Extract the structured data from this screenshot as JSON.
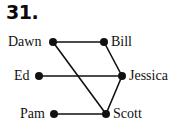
{
  "figure": {
    "problem_number": "31.",
    "background_color": "#ffffff",
    "ink_color": "#111111",
    "width": 186,
    "height": 135
  },
  "graph": {
    "type": "undirected-graph",
    "node_radius": 4,
    "edge_width": 1.6,
    "nodes": [
      {
        "id": "dawn",
        "label": "Dawn",
        "x": 53,
        "y": 42,
        "label_side": "left",
        "label_x": 8,
        "label_y": 35
      },
      {
        "id": "bill",
        "label": "Bill",
        "x": 104,
        "y": 42,
        "label_side": "right",
        "label_x": 111,
        "label_y": 35
      },
      {
        "id": "ed",
        "label": "Ed",
        "x": 39,
        "y": 76,
        "label_side": "left",
        "label_x": 14,
        "label_y": 69
      },
      {
        "id": "jessica",
        "label": "Jessica",
        "x": 122,
        "y": 76,
        "label_side": "right",
        "label_x": 129,
        "label_y": 69
      },
      {
        "id": "pam",
        "label": "Pam",
        "x": 54,
        "y": 114,
        "label_side": "left",
        "label_x": 20,
        "label_y": 107
      },
      {
        "id": "scott",
        "label": "Scott",
        "x": 106,
        "y": 114,
        "label_side": "right",
        "label_x": 113,
        "label_y": 107
      }
    ],
    "edges": [
      {
        "id": "dawn-bill",
        "from": "dawn",
        "to": "bill"
      },
      {
        "id": "dawn-scott",
        "from": "dawn",
        "to": "scott"
      },
      {
        "id": "bill-jessica",
        "from": "bill",
        "to": "jessica"
      },
      {
        "id": "ed-jessica",
        "from": "ed",
        "to": "jessica"
      },
      {
        "id": "pam-scott",
        "from": "pam",
        "to": "scott"
      },
      {
        "id": "scott-jessica",
        "from": "scott",
        "to": "jessica"
      }
    ]
  }
}
